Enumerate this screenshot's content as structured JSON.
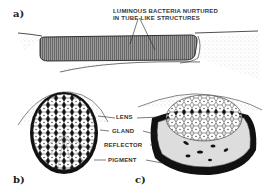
{
  "figure": {
    "panels": [
      {
        "id": "a",
        "label": "a)",
        "annotation_line1": "LUMINOUS BACTERIA NURTURED",
        "annotation_line2": "IN TUBE-LIKE STRUCTURES"
      },
      {
        "id": "b",
        "label": "b)"
      },
      {
        "id": "c",
        "label": "c)"
      }
    ],
    "parts": [
      "LENS",
      "GLAND",
      "REFLECTOR",
      "PIGMENT"
    ],
    "colors": {
      "ink": "#1a1a1a",
      "tube_fill": "#8a8a8a",
      "stipple": "#bdbdbd",
      "paper": "#ffffff"
    }
  }
}
